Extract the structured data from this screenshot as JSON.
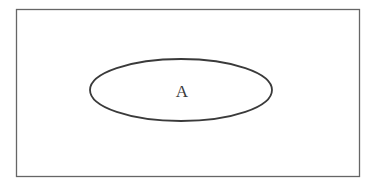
{
  "diagram": {
    "type": "venn",
    "universe": {
      "label": ""
    },
    "sets": [
      {
        "label": "A"
      }
    ],
    "colors": {
      "stroke": "#555555",
      "ellipse_stroke": "#3a3a3a",
      "background": "#ffffff"
    }
  }
}
